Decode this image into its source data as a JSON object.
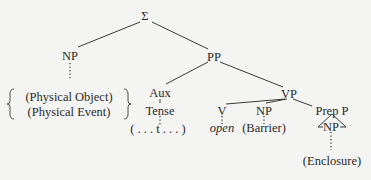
{
  "diagram": {
    "type": "syntax-tree",
    "root": {
      "label": "Σ"
    },
    "nodes": {
      "root": "Σ",
      "np_subject": "NP",
      "np_subject_options": [
        "(Physical Object)",
        "(Physical Event)"
      ],
      "pp": "PP",
      "aux": "Aux",
      "tense": "Tense",
      "tense_value": "( . . . t . . . )",
      "vp": "VP",
      "v": "V",
      "v_value": "open",
      "np_object": "NP",
      "np_object_value": "(Barrier)",
      "prep_p": "Prep P",
      "np_prep": "NP",
      "np_prep_value": "(Enclosure)"
    },
    "edges": [
      [
        "Σ",
        "NP"
      ],
      [
        "Σ",
        "PP"
      ],
      [
        "NP",
        "{(Physical Object) | (Physical Event)}",
        "dotted"
      ],
      [
        "PP",
        "Aux"
      ],
      [
        "PP",
        "VP"
      ],
      [
        "Aux",
        "Tense"
      ],
      [
        "Tense",
        "( . . . t . . . )",
        "dotted"
      ],
      [
        "VP",
        "V"
      ],
      [
        "VP",
        "NP"
      ],
      [
        "VP",
        "Prep P"
      ],
      [
        "V",
        "open",
        "dotted"
      ],
      [
        "NP",
        "(Barrier)",
        "dotted"
      ],
      [
        "Prep P",
        "NP",
        "triangle"
      ],
      [
        "NP",
        "(Enclosure)",
        "dotted"
      ]
    ]
  }
}
